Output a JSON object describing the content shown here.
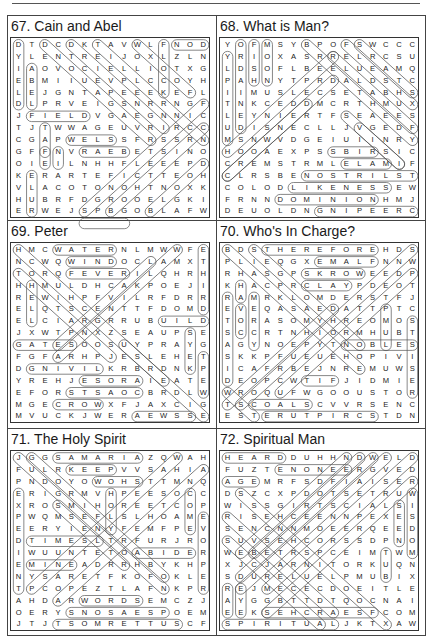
{
  "page": {
    "puzzles": [
      {
        "number": "67",
        "title": "67. Cain and Abel",
        "rows": [
          "DTDCDKTAVWLFNOD",
          "YLENTREIJOXLZLN",
          "IAOVOCIELLIOTXG",
          "EBMIIUEVPLCCOYH",
          "LEJGNTAPEEEKEFL",
          "DLPRVEIGSNRRNGF",
          "JFIELDVGAEGNNIC",
          "TJTWWAGEUVRIRCC",
          "CGAPWELSSFRSSRN",
          "GFFNVRAEBETSINO",
          "OIEILNHHFLEEEPD",
          "KERARTEFICTTEOH",
          "VLACOTONOHTNOXK",
          "HUBRFDGROOELGKI",
          "ERWEJSPBGOBLAFW"
        ],
        "marks": [
          {
            "r": 0,
            "c": 12,
            "dr": 0,
            "dc": 1,
            "len": 3
          },
          {
            "r": 0,
            "c": 11,
            "dr": 1,
            "dc": 0,
            "len": 5
          },
          {
            "r": 0,
            "c": 0,
            "dr": 1,
            "dc": 0,
            "len": 6
          },
          {
            "r": 2,
            "c": 1,
            "dr": 1,
            "dc": 0,
            "len": 4
          },
          {
            "r": 6,
            "c": 1,
            "dr": 0,
            "dc": 1,
            "len": 5
          },
          {
            "r": 7,
            "c": 2,
            "dr": 1,
            "dc": 0,
            "len": 3
          },
          {
            "r": 8,
            "c": 4,
            "dr": 0,
            "dc": 1,
            "len": 4
          },
          {
            "r": 9,
            "c": 5,
            "dr": 0,
            "dc": 1,
            "len": 4
          },
          {
            "r": 9,
            "c": 3,
            "dr": 1,
            "dc": 0,
            "len": 2
          },
          {
            "r": 9,
            "c": 2,
            "dr": 1,
            "dc": 0,
            "len": 2
          },
          {
            "r": 11,
            "c": 1,
            "dr": 1,
            "dc": 0,
            "len": 4
          },
          {
            "r": 0,
            "c": 2,
            "dr": 1,
            "dc": 1,
            "len": 9
          },
          {
            "r": 0,
            "c": 4,
            "dr": 1,
            "dc": 1,
            "len": 8
          },
          {
            "r": 0,
            "c": 6,
            "dr": 1,
            "dc": 1,
            "len": 9
          },
          {
            "r": 0,
            "c": 9,
            "dr": 1,
            "dc": 1,
            "len": 5
          },
          {
            "r": 5,
            "c": 14,
            "dr": 1,
            "dc": -1,
            "len": 10
          },
          {
            "r": 7,
            "c": 14,
            "dr": 1,
            "dc": -1,
            "len": 8
          },
          {
            "r": 10,
            "c": 14,
            "dr": 1,
            "dc": -1,
            "len": 5
          },
          {
            "r": 15,
            "c": 5,
            "dr": 0,
            "dc": 1,
            "len": 4
          }
        ]
      },
      {
        "number": "68",
        "title": "68. What is Man?",
        "rows": [
          "YOFMSYBPOFSWCCC",
          "YRIOXASRRELRCSU",
          "LDSOFLBEELUEAMQ",
          "PAHNYTPRDALDSTC",
          "IIMUSLECSETABHS",
          "TNKCEDDMCRTHMUX",
          "LEYNIERTFSEAEES",
          "UDISNECLLJVGEDF",
          "MSNWVDGEIUIINRY",
          "HOOAEXPSSBIRSIC",
          "CREMSTRMLELAMIF",
          "CLRSBENOSTRILST",
          "COLODLIKENESSEW",
          "FRNNDOMINIONHMJ",
          "DEUOLDNGNIPEERC"
        ],
        "marks": [
          {
            "r": 0,
            "c": 1,
            "dr": 1,
            "dc": 0,
            "len": 8
          },
          {
            "r": 0,
            "c": 2,
            "dr": 1,
            "dc": 0,
            "len": 4
          },
          {
            "r": 0,
            "c": 3,
            "dr": 1,
            "dc": 0,
            "len": 4
          },
          {
            "r": 1,
            "c": 0,
            "dr": 1,
            "dc": 0,
            "len": 8
          },
          {
            "r": 9,
            "c": 8,
            "dr": 0,
            "dc": 1,
            "len": 4
          },
          {
            "r": 10,
            "c": 9,
            "dr": 0,
            "dc": 1,
            "len": 4
          },
          {
            "r": 11,
            "c": 6,
            "dr": 0,
            "dc": 1,
            "len": 9
          },
          {
            "r": 12,
            "c": 5,
            "dr": 0,
            "dc": 1,
            "len": 8
          },
          {
            "r": 13,
            "c": 4,
            "dr": 0,
            "dc": 1,
            "len": 8
          },
          {
            "r": 14,
            "c": 7,
            "dr": 0,
            "dc": 1,
            "len": 8
          },
          {
            "r": 0,
            "c": 6,
            "dr": 1,
            "dc": 1,
            "len": 9
          },
          {
            "r": 0,
            "c": 9,
            "dr": 1,
            "dc": 1,
            "len": 6
          },
          {
            "r": 0,
            "c": 10,
            "dr": 1,
            "dc": 1,
            "len": 5
          },
          {
            "r": 1,
            "c": 8,
            "dr": 1,
            "dc": 1,
            "len": 7
          },
          {
            "r": 3,
            "c": 8,
            "dr": 1,
            "dc": -1,
            "len": 9
          },
          {
            "r": 1,
            "c": 8,
            "dr": 1,
            "dc": -1,
            "len": 9
          },
          {
            "r": 5,
            "c": 6,
            "dr": 1,
            "dc": -1,
            "len": 7
          },
          {
            "r": 7,
            "c": 10,
            "dr": 1,
            "dc": 1,
            "len": 4
          },
          {
            "r": 6,
            "c": 9,
            "dr": 1,
            "dc": 1,
            "len": 5
          }
        ]
      },
      {
        "number": "69",
        "title": "69. Peter",
        "rows": [
          "HMCWATERNLMWWFE",
          "NCWQWINDOCLAMXT",
          "TORQFEVERILQHRH",
          "HHMULDHCAKPOEJI",
          "REWIHPFVILRFDRR",
          "ELQTSCENTTFDOMD",
          "ELCIARGRRUBUILD",
          "JXWTPNXZSEAUPSE",
          "GATESOOSUYPRAYG",
          "FGFARHPJESLEHET",
          "DGNIVILKRBRDNKP",
          "YREHJESORAIEATE",
          "EFORSTSAOCBRDLW",
          "MGECROWXFJAXCIG",
          "MVUCKJWERAEWSSE"
        ],
        "marks": [
          {
            "r": 0,
            "c": 3,
            "dr": 0,
            "dc": 1,
            "len": 5
          },
          {
            "r": 1,
            "c": 4,
            "dr": 0,
            "dc": 1,
            "len": 4
          },
          {
            "r": 2,
            "c": 4,
            "dr": 0,
            "dc": 1,
            "len": 5
          },
          {
            "r": 6,
            "c": 11,
            "dr": 0,
            "dc": 1,
            "len": 4
          },
          {
            "r": 8,
            "c": 0,
            "dr": 0,
            "dc": 1,
            "len": 5
          },
          {
            "r": 10,
            "c": 1,
            "dr": 0,
            "dc": 1,
            "len": 6
          },
          {
            "r": 11,
            "c": 5,
            "dr": 0,
            "dc": 1,
            "len": 5
          },
          {
            "r": 12,
            "c": 4,
            "dr": 0,
            "dc": 1,
            "len": 6
          },
          {
            "r": 13,
            "c": 3,
            "dr": 0,
            "dc": 1,
            "len": 4
          },
          {
            "r": 14,
            "c": 9,
            "dr": 0,
            "dc": 1,
            "len": 5
          },
          {
            "r": 0,
            "c": 14,
            "dr": 1,
            "dc": 0,
            "len": 6
          },
          {
            "r": 3,
            "c": 1,
            "dr": 1,
            "dc": 0,
            "len": 4
          },
          {
            "r": 7,
            "c": 13,
            "dr": 1,
            "dc": 0,
            "len": 4
          },
          {
            "r": 9,
            "c": 14,
            "dr": 1,
            "dc": 0,
            "len": 4
          },
          {
            "r": 0,
            "c": 0,
            "dr": 1,
            "dc": 1,
            "len": 12
          },
          {
            "r": 2,
            "c": 0,
            "dr": 1,
            "dc": 1,
            "len": 8
          },
          {
            "r": 0,
            "c": 12,
            "dr": 1,
            "dc": -1,
            "len": 10
          },
          {
            "r": 1,
            "c": 10,
            "dr": 1,
            "dc": -1,
            "len": 8
          },
          {
            "r": 8,
            "c": 8,
            "dr": 1,
            "dc": 1,
            "len": 7
          }
        ]
      },
      {
        "number": "70",
        "title": "70. Who's In Charge?",
        "rows": [
          "BDSTHEREFOREHDS",
          "PLIEQGXEMALFNNW",
          "RHASGPSKROWEEDP",
          "KHACPRCLAYPDEOT",
          "RAMRKLOMDERSTFJ",
          "EVEQASAEDATTPTC",
          "TORASOMYHREOMOS",
          "SCCRTNHIORMHUBT",
          "AGYNOEPYTNOBLES",
          "SKKPFUEUEHOPIVI",
          "ICAFRBEJNREMUWS",
          "DEOPCWTIFJIDMIE",
          "WROQUFWGOOUSTOR",
          "TSCOALSCVVRSENC",
          "ESTERUTPIRCSTDN"
        ],
        "marks": [
          {
            "r": 0,
            "c": 3,
            "dr": 0,
            "dc": 1,
            "len": 9
          },
          {
            "r": 1,
            "c": 7,
            "dr": 0,
            "dc": 1,
            "len": 5
          },
          {
            "r": 2,
            "c": 6,
            "dr": 0,
            "dc": 1,
            "len": 5
          },
          {
            "r": 3,
            "c": 6,
            "dr": 0,
            "dc": 1,
            "len": 4
          },
          {
            "r": 8,
            "c": 9,
            "dr": 0,
            "dc": 1,
            "len": 6
          },
          {
            "r": 11,
            "c": 6,
            "dr": 0,
            "dc": 1,
            "len": 3
          },
          {
            "r": 13,
            "c": 2,
            "dr": 0,
            "dc": 1,
            "len": 5
          },
          {
            "r": 14,
            "c": 3,
            "dr": 0,
            "dc": 1,
            "len": 9
          },
          {
            "r": 4,
            "c": 0,
            "dr": 1,
            "dc": 0,
            "len": 8
          },
          {
            "r": 5,
            "c": 1,
            "dr": 1,
            "dc": 0,
            "len": 3
          },
          {
            "r": 3,
            "c": 1,
            "dr": 1,
            "dc": 0,
            "len": 2
          },
          {
            "r": 4,
            "c": 2,
            "dr": 1,
            "dc": 0,
            "len": 5
          },
          {
            "r": 5,
            "c": 12,
            "dr": 1,
            "dc": 0,
            "len": 4
          },
          {
            "r": 6,
            "c": 14,
            "dr": 1,
            "dc": 0,
            "len": 7
          },
          {
            "r": 0,
            "c": 0,
            "dr": 1,
            "dc": 1,
            "len": 11
          },
          {
            "r": 0,
            "c": 2,
            "dr": 1,
            "dc": 1,
            "len": 9
          },
          {
            "r": 0,
            "c": 14,
            "dr": 1,
            "dc": -1,
            "len": 14
          },
          {
            "r": 2,
            "c": 14,
            "dr": 1,
            "dc": -1,
            "len": 11
          },
          {
            "r": 5,
            "c": 8,
            "dr": 1,
            "dc": -1,
            "len": 9
          },
          {
            "r": 12,
            "c": 0,
            "dr": 1,
            "dc": 1,
            "len": 3
          }
        ]
      },
      {
        "number": "71",
        "title": "71. The Holy Spirit",
        "rows": [
          "JGGSAMARIAZQWAH",
          "FULRKEEPVVSAHIA",
          "PNDOYOWOHSTTMNQ",
          "ERIGRMVHPEESOCC",
          "XROSMIHOREETCOP",
          "PWQMSEFLSLHOAME",
          "EERYIENYFEMFPEV",
          "DTIMESLTRFURJRO",
          "IWUUNTETOABIDER",
          "EMINEADRRHBYKHP",
          "NYSARETFKOFOKLE",
          "TPCOPEZTLAFNKPR",
          "AHDARWORDSEMCZJ",
          "OERYSNOSAESPOEM",
          "JTJTSOMRETTUSCF"
        ],
        "marks": [
          {
            "r": 0,
            "c": 3,
            "dr": 0,
            "dc": 1,
            "len": 7
          },
          {
            "r": 1,
            "c": 4,
            "dr": 0,
            "dc": 1,
            "len": 4
          },
          {
            "r": 2,
            "c": 6,
            "dr": 0,
            "dc": 1,
            "len": 4
          },
          {
            "r": 7,
            "c": 1,
            "dr": 0,
            "dc": 1,
            "len": 6
          },
          {
            "r": 8,
            "c": 9,
            "dr": 0,
            "dc": 1,
            "len": 5
          },
          {
            "r": 9,
            "c": 1,
            "dr": 0,
            "dc": 1,
            "len": 4
          },
          {
            "r": 12,
            "c": 5,
            "dr": 0,
            "dc": 1,
            "len": 5
          },
          {
            "r": 13,
            "c": 4,
            "dr": 0,
            "dc": 1,
            "len": 8
          },
          {
            "r": 14,
            "c": 3,
            "dr": 0,
            "dc": 1,
            "len": 10
          },
          {
            "r": 3,
            "c": 7,
            "dr": 1,
            "dc": 0,
            "len": 4
          },
          {
            "r": 3,
            "c": 13,
            "dr": 1,
            "dc": 0,
            "len": 4
          },
          {
            "r": 5,
            "c": 14,
            "dr": 1,
            "dc": 0,
            "len": 7
          },
          {
            "r": 3,
            "c": 0,
            "dr": 1,
            "dc": 0,
            "len": 9
          },
          {
            "r": 0,
            "c": 0,
            "dr": 1,
            "dc": 1,
            "len": 12
          },
          {
            "r": 0,
            "c": 1,
            "dr": 1,
            "dc": 1,
            "len": 11
          },
          {
            "r": 0,
            "c": 12,
            "dr": 1,
            "dc": -1,
            "len": 12
          },
          {
            "r": 1,
            "c": 14,
            "dr": 1,
            "dc": -1,
            "len": 12
          },
          {
            "r": 4,
            "c": 3,
            "dr": 1,
            "dc": 1,
            "len": 6
          }
        ]
      },
      {
        "number": "72",
        "title": "72. Spiritual Man",
        "rows": [
          "HEARDDUHHNDWELD",
          "FUZTENONEERGVED",
          "AGEMRFSDFIAISER",
          "DSZCXPDOTSETRUW",
          "WISSGIRTSCIALSI",
          "RISEHCEENNPEXES",
          "SENCNNMOEERQEED",
          "SUVSEHCORSSDPNO",
          "WEBETRSPCEIMTWM",
          "XJCJARNITORKUQN",
          "SDURELUELPMUBIX",
          "REJMECECDOEITLE",
          "AYGGBTTDTQOCNAI",
          "EEKSEHCRAESFCOM",
          "SPIRITUALJKTXAW"
        ],
        "marks": [
          {
            "r": 0,
            "c": 0,
            "dr": 0,
            "dc": 1,
            "len": 5
          },
          {
            "r": 1,
            "c": 4,
            "dr": 0,
            "dc": 1,
            "len": 6
          },
          {
            "r": 2,
            "c": 0,
            "dr": 0,
            "dc": 1,
            "len": 3
          },
          {
            "r": 13,
            "c": 3,
            "dr": 0,
            "dc": 1,
            "len": 9
          },
          {
            "r": 14,
            "c": 0,
            "dr": 0,
            "dc": 1,
            "len": 9
          },
          {
            "r": 4,
            "c": 13,
            "dr": 1,
            "dc": 0,
            "len": 4
          },
          {
            "r": 3,
            "c": 14,
            "dr": 1,
            "dc": 0,
            "len": 6
          },
          {
            "r": 8,
            "c": 12,
            "dr": 1,
            "dc": 0,
            "len": 3
          },
          {
            "r": 11,
            "c": 0,
            "dr": 1,
            "dc": 0,
            "len": 3
          },
          {
            "r": 11,
            "c": 1,
            "dr": 1,
            "dc": 0,
            "len": 3
          },
          {
            "r": 0,
            "c": 9,
            "dr": 1,
            "dc": -1,
            "len": 9
          },
          {
            "r": 0,
            "c": 10,
            "dr": 1,
            "dc": -1,
            "len": 9
          },
          {
            "r": 0,
            "c": 11,
            "dr": 1,
            "dc": -1,
            "len": 11
          },
          {
            "r": 0,
            "c": 12,
            "dr": 1,
            "dc": -1,
            "len": 12
          },
          {
            "r": 0,
            "c": 14,
            "dr": 1,
            "dc": -1,
            "len": 12
          },
          {
            "r": 3,
            "c": 1,
            "dr": 1,
            "dc": 1,
            "len": 12
          },
          {
            "r": 5,
            "c": 0,
            "dr": 1,
            "dc": 1,
            "len": 9
          },
          {
            "r": 7,
            "c": 0,
            "dr": 1,
            "dc": 1,
            "len": 8
          },
          {
            "r": 2,
            "c": 14,
            "dr": 1,
            "dc": -1,
            "len": 12
          }
        ]
      }
    ]
  }
}
